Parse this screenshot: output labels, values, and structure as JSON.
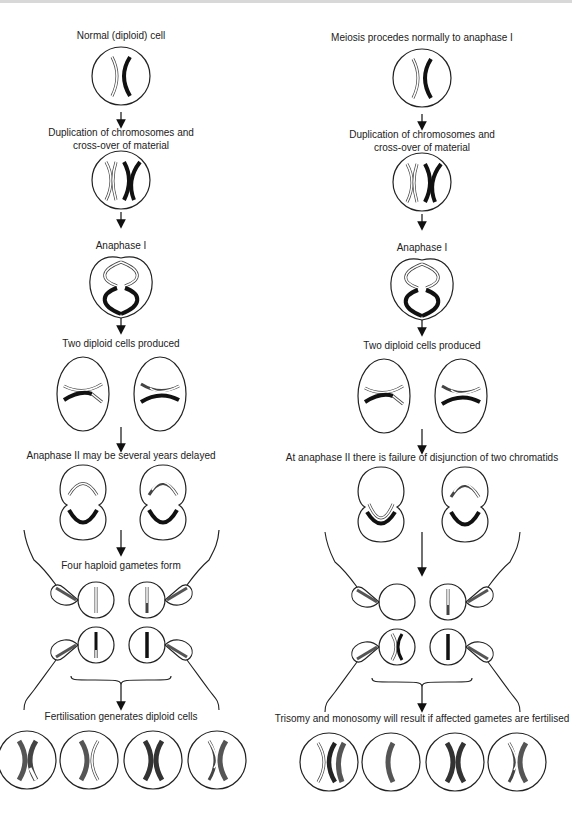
{
  "left_column": {
    "title": "Normal meiosis",
    "steps": [
      "Normal (diploid) cell",
      "Duplication of chromosomes and",
      "cross-over of material",
      "Anaphase I",
      "Two diploid cells produced",
      "Anaphase II may be several years delayed",
      "Four haploid gametes form",
      "Fertilisation generates diploid cells"
    ]
  },
  "right_column": {
    "title": "Nondisjunction",
    "steps": [
      "Meiosis procedes normally to anaphase I",
      "Duplication of chromosomes and",
      "cross-over of material",
      "Anaphase I",
      "Two diploid cells produced",
      "At anaphase II there is failure of disjunction of two chromatids",
      "",
      "Trisomy and monosomy will result if affected gametes are fertilised"
    ]
  },
  "colors": {
    "outline": "#222222",
    "dark_chromosome": "#1a1a1a",
    "grey_chromosome": "#555555",
    "light_chromosome": "#ffffff",
    "background": "#ffffff"
  }
}
